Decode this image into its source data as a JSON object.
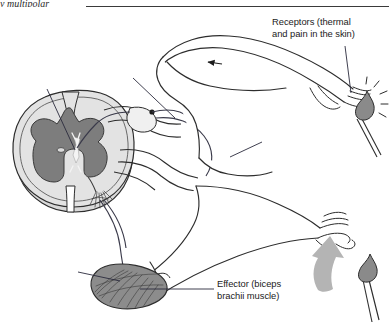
{
  "figure": {
    "domain_label": "anatomy-diagram",
    "title_fragment": "y multipolar",
    "width": 389,
    "height": 324,
    "background_color": "#ffffff"
  },
  "header": {
    "running_head_text": "y multipolar",
    "rule_color": "#3a3a3a"
  },
  "labels": {
    "receptors": {
      "text": "Receptors (thermal\nand pain in the skin)",
      "line1": "Receptors (thermal",
      "line2": "and pain in the skin)",
      "color": "#1b1b1b"
    },
    "effector": {
      "text": "Effector (biceps\nbrachii muscle)",
      "line1": "Effector (biceps",
      "line2": "brachii muscle)",
      "color": "#1b1b1b"
    }
  },
  "structures": [
    {
      "name": "spinal-cord-cross-section",
      "description": "Transverse section of spinal cord with butterfly-shaped grey matter"
    },
    {
      "name": "grey-matter",
      "description": "Butterfly / H-shaped central grey matter"
    },
    {
      "name": "white-matter",
      "description": "Outer pale white matter"
    },
    {
      "name": "central-canal",
      "description": "Small oval central canal"
    },
    {
      "name": "interneuron",
      "description": "White interneuron cell body in grey matter"
    },
    {
      "name": "dorsal-root-ganglion",
      "description": "Swelling on dorsal root containing sensory cell body"
    },
    {
      "name": "sensory-neuron-axon",
      "description": "Afferent fibre running from skin receptors to cord"
    },
    {
      "name": "motor-neuron-axon",
      "description": "Efferent fibre running from ventral horn to biceps"
    },
    {
      "name": "motor-end-plate",
      "description": "Branching terminal arborisation in ventral horn region"
    },
    {
      "name": "extended-arm",
      "description": "Upper arm extended with hand near flame"
    },
    {
      "name": "withdrawn-arm",
      "description": "Lower arm flexed away from flame"
    },
    {
      "name": "biceps-brachii",
      "description": "Shaded teardrop muscle belly with striations"
    },
    {
      "name": "match-flame-upper",
      "description": "Lit match with radiating heat lines"
    },
    {
      "name": "match-flame-lower",
      "description": "Second lit match below"
    },
    {
      "name": "withdrawal-arrow",
      "description": "Large grey curved arrow indicating withdrawal motion"
    },
    {
      "name": "impulse-arrow",
      "description": "Small black arrowhead on arm showing impulse direction"
    }
  ],
  "colors": {
    "outline": "#2d2d2d",
    "grey_matter": "#7d7d7d",
    "white_matter": "#dcdcdc",
    "muscle": "#8c8c8c",
    "flame": "#8a8a8a",
    "big_arrow": "#b4b4b4",
    "leader_line": "#3d3d54",
    "text": "#1b1b1b"
  }
}
